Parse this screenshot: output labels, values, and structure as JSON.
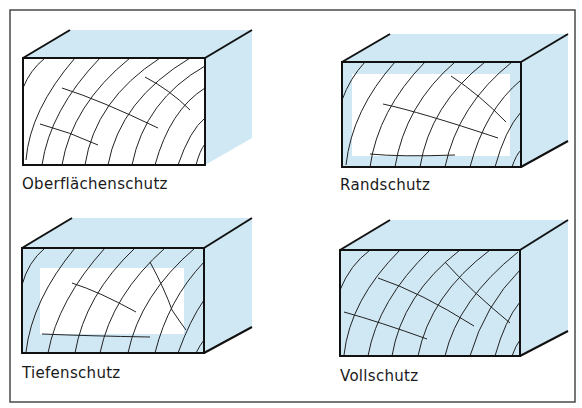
{
  "colors": {
    "frame": "#4a4a4a",
    "outline": "#111111",
    "impregnation_blue": "#cfe8f4",
    "wood_white": "#ffffff",
    "grain": "#222222"
  },
  "panels": [
    {
      "id": "surface",
      "label": "Oberflächenschutz",
      "protection": "surface-only",
      "fill_mode": "none"
    },
    {
      "id": "edge",
      "label": "Randschutz",
      "protection": "thin-edge-layer",
      "fill_mode": "edge"
    },
    {
      "id": "deep",
      "label": "Tiefenschutz",
      "protection": "deep-edge-layer",
      "fill_mode": "deep"
    },
    {
      "id": "full",
      "label": "Vollschutz",
      "protection": "full-penetration",
      "fill_mode": "full"
    }
  ]
}
